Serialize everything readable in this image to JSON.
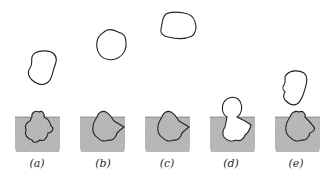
{
  "figure": {
    "colors": {
      "outline": "#222222",
      "hatch_fill": "#b8b8b8",
      "hatch_line": "#8a8a8a",
      "background": "#ffffff"
    },
    "panels": [
      {
        "id": "a",
        "label": "(a)",
        "label_x": 29,
        "free_particle": "irregular blob approaching"
      },
      {
        "id": "b",
        "label": "(b)",
        "label_x": 95,
        "free_particle": "rounded blob"
      },
      {
        "id": "c",
        "label": "(c)",
        "label_x": 159,
        "free_particle": "flattened blob"
      },
      {
        "id": "d",
        "label": "(d)",
        "label_x": 223,
        "free_particle": "bubble attached to cavity"
      },
      {
        "id": "e",
        "label": "(e)",
        "label_x": 288,
        "free_particle": "blob leaving"
      }
    ]
  }
}
